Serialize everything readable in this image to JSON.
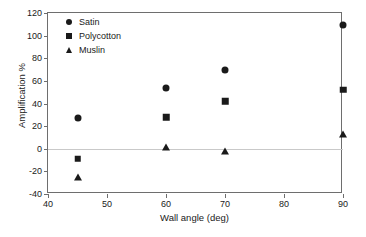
{
  "chart_data": {
    "type": "scatter",
    "title": "",
    "xlabel": "Wall angle (deg)",
    "ylabel": "Amplification %",
    "xlim": [
      40,
      90
    ],
    "ylim": [
      -40,
      120
    ],
    "xticks": [
      40,
      50,
      60,
      70,
      80,
      90
    ],
    "yticks": [
      -40,
      -20,
      0,
      20,
      40,
      60,
      80,
      100,
      120
    ],
    "xtick_labels": [
      "40",
      "50",
      "60",
      "70",
      "80",
      "90"
    ],
    "ytick_labels": [
      "-40",
      "-20",
      "0",
      "20",
      "40",
      "60",
      "80",
      "100",
      "120"
    ],
    "grid": false,
    "zero_line": true,
    "legend_position": "top-left",
    "x": [
      45,
      60,
      70,
      90
    ],
    "series": [
      {
        "name": "Satin",
        "marker": "circle",
        "color": "#1a1a1a",
        "values": [
          27,
          54,
          70,
          109
        ]
      },
      {
        "name": "Polycotton",
        "marker": "square",
        "color": "#1a1a1a",
        "values": [
          -9,
          28,
          42,
          52
        ]
      },
      {
        "name": "Muslin",
        "marker": "triangle",
        "color": "#1a1a1a",
        "values": [
          -25,
          1.5,
          -2,
          13
        ]
      }
    ]
  },
  "axis": {
    "x_title": "Wall angle (deg)",
    "y_title": "Amplification %"
  },
  "legend": {
    "items": [
      {
        "label": "Satin",
        "marker": "circle-marker-icon"
      },
      {
        "label": "Polycotton",
        "marker": "square-marker-icon"
      },
      {
        "label": "Muslin",
        "marker": "triangle-marker-icon"
      }
    ]
  }
}
